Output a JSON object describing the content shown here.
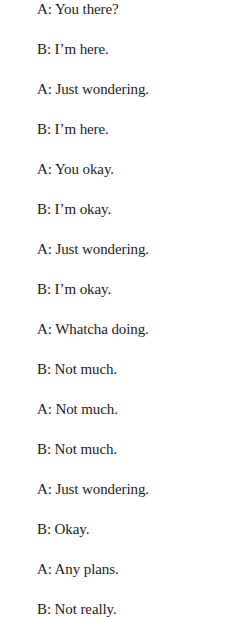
{
  "dialogue": [
    {
      "speaker": "A",
      "text": "A: You there?"
    },
    {
      "speaker": "B",
      "text": "B: I’m here."
    },
    {
      "speaker": "A",
      "text": "A: Just wondering."
    },
    {
      "speaker": "B",
      "text": "B: I’m here."
    },
    {
      "speaker": "A",
      "text": "A: You okay."
    },
    {
      "speaker": "B",
      "text": "B: I’m okay."
    },
    {
      "speaker": "A",
      "text": "A: Just wondering."
    },
    {
      "speaker": "B",
      "text": "B: I’m okay."
    },
    {
      "speaker": "A",
      "text": "A: Whatcha doing."
    },
    {
      "speaker": "B",
      "text": "B: Not much."
    },
    {
      "speaker": "A",
      "text": "A: Not much."
    },
    {
      "speaker": "B",
      "text": "B: Not much."
    },
    {
      "speaker": "A",
      "text": "A: Just wondering."
    },
    {
      "speaker": "B",
      "text": "B: Okay."
    },
    {
      "speaker": "A",
      "text": "A: Any plans."
    },
    {
      "speaker": "B",
      "text": "B: Not really."
    }
  ]
}
